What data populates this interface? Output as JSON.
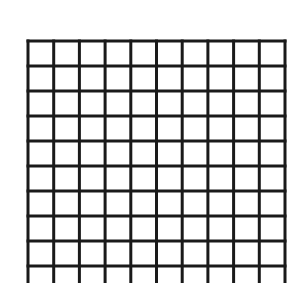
{
  "grid": {
    "columns": 10,
    "rows_visible": 10,
    "left": 28,
    "top": 41,
    "right": 285,
    "bottom_extends_past": 283,
    "cell_width": 25.7,
    "cell_height": 25,
    "line_color": "#1a1a1a",
    "line_width": 3,
    "background": "#ffffff"
  }
}
